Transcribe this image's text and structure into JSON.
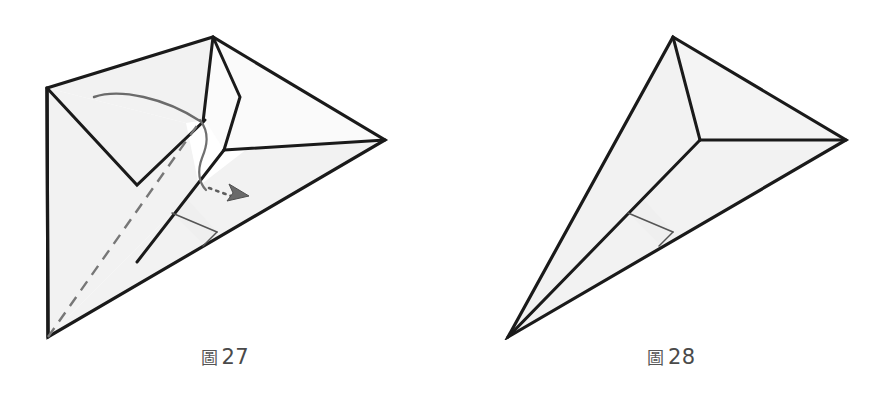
{
  "page": {
    "background_color": "#ffffff",
    "width": 893,
    "height": 399,
    "content_type": "origami-fold-diagram-pair"
  },
  "style": {
    "paper_fill": "#f2f2f2",
    "paper_fill_light": "#f8f8f8",
    "outline_color": "#1a1a1a",
    "crease_color": "#6e6e6e",
    "fold_arrow_color": "#6b6b6b",
    "dashed_color": "#777777",
    "caption_color": "#4a4a4a"
  },
  "figures": [
    {
      "id": "figure-27",
      "caption_label": "圖",
      "caption_number": "27",
      "caption_text": "圖 27",
      "description": "Origami kite-base step showing a flap being unfolded, with a curved fold arrow, a dashed valley-fold line and a dotted push arrow.",
      "annotations": {
        "curved_fold_arrow": "curved-arrow-left-to-center",
        "dashed_fold_line": "valley-fold-dashed",
        "dotted_push_arrow": "dotted-arrow-pointing-right"
      }
    },
    {
      "id": "figure-28",
      "caption_label": "圖",
      "caption_number": "28",
      "caption_text": "圖 28",
      "description": "Resulting shape after the fold: a narrow triangular form with a central Y junction and a small crease near the lower edge.",
      "annotations": {}
    }
  ]
}
